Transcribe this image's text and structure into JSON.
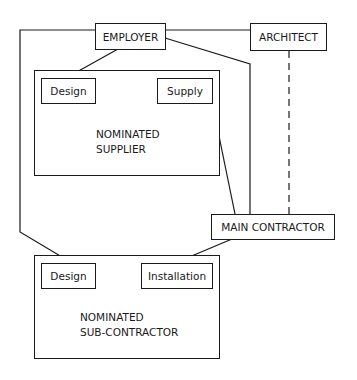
{
  "diagram": {
    "nodes": {
      "employer": "EMPLOYER",
      "architect": "ARCHITECT",
      "main_contractor": "MAIN CONTRACTOR",
      "supplier": {
        "title_line1": "NOMINATED",
        "title_line2": "SUPPLIER",
        "design": "Design",
        "supply": "Supply"
      },
      "subcontractor": {
        "title_line1": "NOMINATED",
        "title_line2": "SUB-CONTRACTOR",
        "design": "Design",
        "installation": "Installation"
      }
    },
    "edges": [
      {
        "from": "EMPLOYER",
        "to": "ARCHITECT",
        "style": "solid"
      },
      {
        "from": "EMPLOYER",
        "to": "Supplier Design",
        "style": "solid"
      },
      {
        "from": "EMPLOYER",
        "to": "MAIN CONTRACTOR",
        "style": "solid"
      },
      {
        "from": "EMPLOYER",
        "to": "Sub-contractor Design",
        "style": "solid"
      },
      {
        "from": "ARCHITECT",
        "to": "MAIN CONTRACTOR",
        "style": "dashed"
      },
      {
        "from": "Supply",
        "to": "MAIN CONTRACTOR",
        "style": "solid"
      },
      {
        "from": "MAIN CONTRACTOR",
        "to": "Installation",
        "style": "solid"
      }
    ]
  }
}
